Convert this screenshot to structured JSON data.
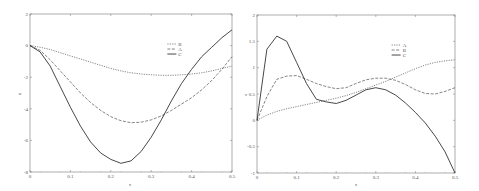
{
  "chart_data": [
    {
      "type": "line",
      "title": "",
      "xlabel": "x",
      "ylabel": "u",
      "xlim": [
        0,
        0.5
      ],
      "ylim": [
        -8,
        2
      ],
      "xticks": [
        "0",
        "0.1",
        "0.2",
        "0.3",
        "0.4",
        "0.5"
      ],
      "yticks": [
        "2",
        "0",
        "-2",
        "-4",
        "-6",
        "-8"
      ],
      "legend": [
        "B",
        "A",
        "C"
      ],
      "legend_position": "upper-right-inner",
      "grid": false,
      "x": [
        0,
        0.025,
        0.05,
        0.075,
        0.1,
        0.125,
        0.15,
        0.175,
        0.2,
        0.225,
        0.25,
        0.275,
        0.3,
        0.325,
        0.35,
        0.375,
        0.4,
        0.425,
        0.45,
        0.475,
        0.5
      ],
      "series": [
        {
          "name": "B",
          "style": "dotted",
          "values": [
            0,
            -0.1,
            -0.25,
            -0.45,
            -0.65,
            -0.85,
            -1.05,
            -1.25,
            -1.45,
            -1.6,
            -1.72,
            -1.8,
            -1.85,
            -1.88,
            -1.88,
            -1.85,
            -1.8,
            -1.72,
            -1.6,
            -1.45,
            -1.3
          ]
        },
        {
          "name": "A",
          "style": "dashed",
          "values": [
            0,
            -0.3,
            -0.9,
            -1.6,
            -2.3,
            -3.0,
            -3.6,
            -4.1,
            -4.5,
            -4.75,
            -4.88,
            -4.85,
            -4.7,
            -4.45,
            -4.1,
            -3.7,
            -3.3,
            -2.8,
            -2.2,
            -1.5,
            -0.7
          ]
        },
        {
          "name": "C",
          "style": "solid",
          "values": [
            0,
            -0.4,
            -1.3,
            -2.6,
            -3.9,
            -5.1,
            -6.1,
            -6.8,
            -7.2,
            -7.45,
            -7.3,
            -6.7,
            -5.8,
            -4.7,
            -3.5,
            -2.4,
            -1.5,
            -0.7,
            -0.1,
            0.5,
            1.0
          ]
        }
      ]
    },
    {
      "type": "line",
      "title": "",
      "xlabel": "x",
      "ylabel": "v",
      "xlim": [
        0,
        0.5
      ],
      "ylim": [
        -1,
        2
      ],
      "xticks": [
        "0",
        "0.1",
        "0.2",
        "0.3",
        "0.4",
        "0.5"
      ],
      "yticks": [
        "2",
        "1.5",
        "1",
        "0.5",
        "0",
        "-0.5",
        "-1"
      ],
      "legend": [
        "A",
        "B",
        "C"
      ],
      "legend_position": "upper-right-inner",
      "grid": false,
      "x": [
        0,
        0.025,
        0.05,
        0.075,
        0.1,
        0.125,
        0.15,
        0.175,
        0.2,
        0.225,
        0.25,
        0.275,
        0.3,
        0.325,
        0.35,
        0.375,
        0.4,
        0.425,
        0.45,
        0.475,
        0.5
      ],
      "series": [
        {
          "name": "A",
          "style": "dotted",
          "values": [
            0,
            0.1,
            0.17,
            0.22,
            0.26,
            0.3,
            0.34,
            0.38,
            0.42,
            0.47,
            0.53,
            0.6,
            0.67,
            0.74,
            0.82,
            0.9,
            0.98,
            1.05,
            1.1,
            1.13,
            1.15
          ]
        },
        {
          "name": "B",
          "style": "dashed",
          "values": [
            0,
            0.45,
            0.78,
            0.84,
            0.85,
            0.78,
            0.7,
            0.64,
            0.6,
            0.62,
            0.7,
            0.77,
            0.8,
            0.8,
            0.76,
            0.68,
            0.58,
            0.51,
            0.5,
            0.55,
            0.62
          ]
        },
        {
          "name": "C",
          "style": "solid",
          "values": [
            0,
            1.35,
            1.6,
            1.5,
            1.1,
            0.7,
            0.4,
            0.35,
            0.32,
            0.38,
            0.48,
            0.58,
            0.62,
            0.58,
            0.48,
            0.33,
            0.15,
            -0.05,
            -0.3,
            -0.6,
            -1.0
          ]
        }
      ]
    }
  ],
  "charts": [
    {
      "ylabel": "u",
      "xlabel": "x",
      "xticks": [
        "0",
        "0.1",
        "0.2",
        "0.3",
        "0.4",
        "0.5"
      ],
      "yticks": [
        "2",
        "0",
        "-2",
        "-4",
        "-6",
        "-8"
      ],
      "legend": [
        "B",
        "A",
        "C"
      ]
    },
    {
      "ylabel": "v",
      "xlabel": "x",
      "xticks": [
        "0",
        "0.1",
        "0.2",
        "0.3",
        "0.4",
        "0.5"
      ],
      "yticks": [
        "2",
        "1.5",
        "1",
        "0.5",
        "0",
        "-0.5",
        "-1"
      ],
      "legend": [
        "A",
        "B",
        "C"
      ]
    }
  ],
  "colors": {
    "line": "#333333",
    "axis": "#666666",
    "background": "#ffffff"
  }
}
